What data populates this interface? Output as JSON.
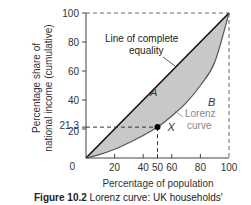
{
  "chart_data": {
    "type": "line",
    "title": "",
    "xlabel": "Percentage of population",
    "ylabel": "Percentage share of national income (cumulative)",
    "ylabel_lines": [
      "Percentage share of",
      "national income (cumulative)"
    ],
    "xlim": [
      0,
      100
    ],
    "ylim": [
      0,
      100
    ],
    "x_ticks": [
      0,
      20,
      40,
      50,
      60,
      80,
      100
    ],
    "x_tick_labels": [
      "0",
      "20",
      "40",
      "50",
      "60",
      "80",
      "100"
    ],
    "y_ticks": [
      0,
      20,
      21.3,
      40,
      60,
      80,
      100
    ],
    "y_tick_labels": [
      "0",
      "20",
      "21.3",
      "40",
      "60",
      "80",
      "100"
    ],
    "grid": false,
    "series": [
      {
        "name": "Line of complete equality",
        "x": [
          0,
          100
        ],
        "y": [
          0,
          100
        ],
        "color": "#111111"
      },
      {
        "name": "Lorenz curve",
        "x": [
          0,
          10,
          20,
          30,
          40,
          50,
          60,
          70,
          80,
          90,
          100
        ],
        "y": [
          0,
          2.5,
          6,
          10.5,
          15.5,
          21.3,
          29,
          38,
          50,
          66,
          100
        ],
        "color": "#555555"
      }
    ],
    "highlight_point": {
      "label": "X",
      "x": 50,
      "y": 21.3
    },
    "regions": [
      {
        "label": "A",
        "description": "area between line of equality and Lorenz curve",
        "fill": "#c8c8c8"
      },
      {
        "label": "B",
        "description": "area below Lorenz curve"
      }
    ],
    "annotations": [
      {
        "text": "Line of complete equality",
        "lines": [
          "Line of complete",
          "equality"
        ]
      },
      {
        "text": "Lorenz curve",
        "lines": [
          "Lorenz",
          "curve"
        ]
      }
    ]
  },
  "caption": {
    "label": "Figure 10.2",
    "text": "Lorenz curve: UK households'"
  }
}
